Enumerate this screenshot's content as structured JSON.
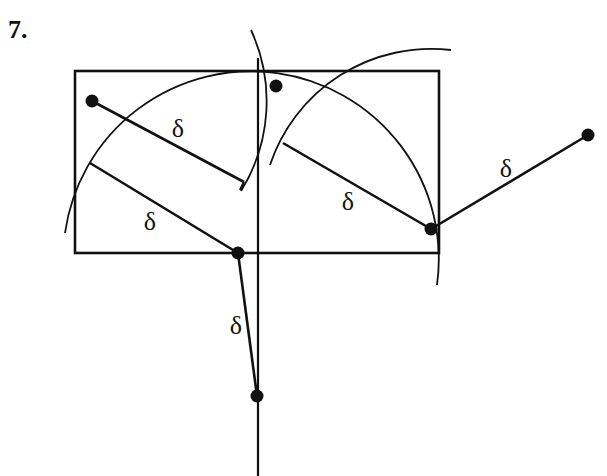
{
  "figure": {
    "number_label": "7.",
    "stroke_color": "#111111",
    "background": "#ffffff",
    "rectangle": {
      "x": 75,
      "y": 71,
      "width": 364,
      "height": 182
    },
    "vertical_line": {
      "x": 258,
      "y1": 58,
      "y2": 476
    },
    "points": [
      {
        "id": "p1",
        "x": 92,
        "y": 101
      },
      {
        "id": "p2",
        "x": 276,
        "y": 86
      },
      {
        "id": "p3",
        "x": 238,
        "y": 253
      },
      {
        "id": "p4",
        "x": 431,
        "y": 229
      },
      {
        "id": "p5",
        "x": 588,
        "y": 135
      },
      {
        "id": "p6",
        "x": 257,
        "y": 396
      }
    ],
    "segments": [
      {
        "id": "s1",
        "x1": 92,
        "y1": 101,
        "x2": 244,
        "y2": 182,
        "label": "δ",
        "lx": 178,
        "ly": 137
      },
      {
        "id": "s2",
        "x1": 90,
        "y1": 163,
        "x2": 238,
        "y2": 253,
        "label": "δ",
        "lx": 150,
        "ly": 230
      },
      {
        "id": "s3",
        "x1": 238,
        "y1": 253,
        "x2": 257,
        "y2": 396,
        "label": "δ",
        "lx": 236,
        "ly": 334
      },
      {
        "id": "s4",
        "x1": 283,
        "y1": 143,
        "x2": 431,
        "y2": 229,
        "label": "δ",
        "lx": 348,
        "ly": 210
      },
      {
        "id": "s5",
        "x1": 431,
        "y1": 229,
        "x2": 588,
        "y2": 135,
        "label": "δ",
        "lx": 506,
        "ly": 177
      }
    ],
    "ticks": [
      {
        "x1": 244,
        "y1": 182,
        "x2": 240,
        "y2": 190
      }
    ],
    "arcs": [
      {
        "id": "arc-big",
        "d": "M 65 233 A 182 182 0 0 1 437 285"
      },
      {
        "id": "arc-left-point",
        "d": "M 251 30 A 170 170 0 0 1 241 191"
      },
      {
        "id": "arc-right-point",
        "d": "M 270 165 A 170 170 0 0 1 451 50"
      }
    ]
  }
}
